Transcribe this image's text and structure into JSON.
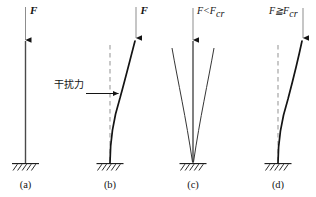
{
  "figure": {
    "title_present": false,
    "background_color": "#ffffff",
    "stroke_color": "#141414",
    "dashed_color": "#9a9a9a",
    "panels": [
      {
        "id": "a",
        "caption": "(a)",
        "force_label": "F",
        "condition_label": "",
        "has_dashed_reference": false,
        "has_disturbance_label": false,
        "column_state": "straight",
        "description_state": "straight-column-with-axial-load"
      },
      {
        "id": "b",
        "caption": "(b)",
        "force_label": "F",
        "condition_label": "",
        "has_dashed_reference": true,
        "has_disturbance_label": true,
        "disturbance_label": "干扰力",
        "column_state": "bent",
        "description_state": "column-bent-by-lateral-disturbance"
      },
      {
        "id": "c",
        "caption": "(c)",
        "force_label": "",
        "condition_label": "F<F",
        "condition_subscript": "cr",
        "has_dashed_reference": false,
        "has_disturbance_label": false,
        "column_state": "straight-with-recovery-curves",
        "description_state": "stable-returns-to-straight"
      },
      {
        "id": "d",
        "caption": "(d)",
        "force_label": "",
        "condition_label": "F≧F",
        "condition_subscript": "cr",
        "has_dashed_reference": true,
        "has_disturbance_label": false,
        "column_state": "bent",
        "description_state": "unstable-remains-bent"
      }
    ],
    "icons": {
      "ground_support": "hatched-fixed-support-icon",
      "force_arrow": "downward-arrow-icon",
      "disturbance_arrow": "rightward-arrow-icon"
    }
  }
}
